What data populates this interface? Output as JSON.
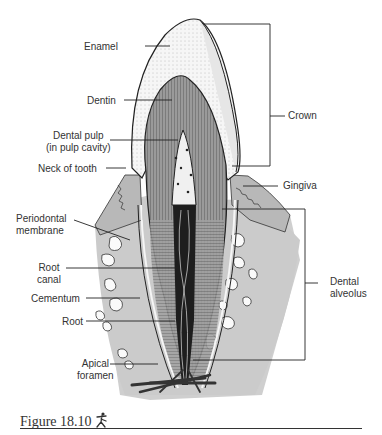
{
  "figure": {
    "caption": "Figure 18.10",
    "caption_icon": "running-figure-icon"
  },
  "labels": {
    "enamel": "Enamel",
    "dentin": "Dentin",
    "dental_pulp_1": "Dental pulp",
    "dental_pulp_2": "(in pulp cavity)",
    "neck_of_tooth": "Neck of tooth",
    "periodontal_1": "Periodontal",
    "periodontal_2": "membrane",
    "root_canal_1": "Root",
    "root_canal_2": "canal",
    "cementum": "Cementum",
    "root": "Root",
    "apical_1": "Apical",
    "apical_2": "foramen",
    "crown": "Crown",
    "gingiva": "Gingiva",
    "dental_alveolus_1": "Dental",
    "dental_alveolus_2": "alveolus"
  },
  "colors": {
    "bone": "#c9c9c9",
    "gingiva": "#b4b4b4",
    "enamel": "#f4f4f4",
    "dentin": "#8a8a8a",
    "pulp": "#efefef",
    "canal": "#222222",
    "line": "#222222"
  }
}
